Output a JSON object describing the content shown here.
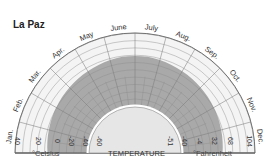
{
  "chart_data": {
    "type": "polar-area",
    "title": "La Paz",
    "center_label": "TEMPERATURE",
    "months": [
      "Jan.",
      "Feb.",
      "Mar.",
      "Apr.",
      "May",
      "June",
      "July",
      "Aug.",
      "Sep.",
      "Oct.",
      "Nov.",
      "Dec."
    ],
    "left_axis": {
      "unit": "°Celsius",
      "ticks": [
        "40",
        "20",
        "0",
        "-20",
        "-40",
        "-60"
      ]
    },
    "right_axis": {
      "unit": "°Fahrenheit",
      "ticks": [
        "-51",
        "-40",
        "-4",
        "32",
        "68",
        "104"
      ]
    },
    "series": [
      {
        "name": "Temperature range (shaded)",
        "band_outer_celsius": [
          10,
          12,
          14,
          16,
          18,
          20,
          20,
          18,
          16,
          14,
          12,
          10
        ],
        "band_inner_celsius": -60
      }
    ],
    "radial_range_celsius": [
      -60,
      40
    ],
    "colors": {
      "band": "#a9a9a9",
      "grid_light": "#eeeeee",
      "grid_line": "#8a8a8a",
      "inner": "#e6e6e6",
      "outline": "#555555"
    }
  },
  "labels": {
    "title": "La Paz",
    "celsius": "°Celsius",
    "fahrenheit": "°Fahrenheit",
    "center": "TEMPERATURE"
  }
}
